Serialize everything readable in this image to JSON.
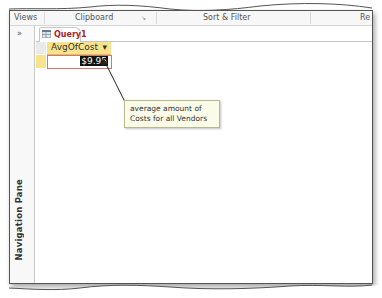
{
  "ribbon": {
    "groups": [
      {
        "label": "Views"
      },
      {
        "label": "Clipboard"
      },
      {
        "label": "Sort & Filter"
      },
      {
        "label": "Re"
      }
    ]
  },
  "navigation_pane": {
    "toggle_glyph": "»",
    "label": "Navigation Pane"
  },
  "document": {
    "tab": {
      "label": "Query1"
    },
    "datasheet": {
      "columns": [
        {
          "header": "AvgOfCost",
          "dropdown_glyph": "▾"
        }
      ],
      "rows": [
        [
          "$9.95"
        ]
      ]
    }
  },
  "callout": {
    "line1": "average amount of",
    "line2": "Costs for all Vendors"
  }
}
